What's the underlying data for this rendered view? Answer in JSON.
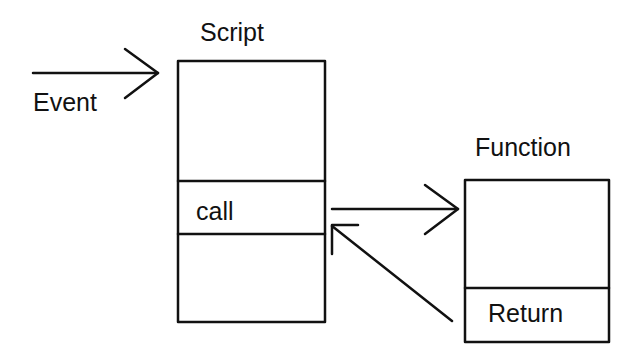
{
  "diagram": {
    "title_script": "Script",
    "title_function": "Function",
    "event_label": "Event",
    "call_label": "call",
    "return_label": "Return",
    "stroke_color": "#111111",
    "background": "#ffffff",
    "nodes": [
      {
        "id": "script",
        "label": "Script",
        "sections": [
          "",
          "call",
          ""
        ]
      },
      {
        "id": "function",
        "label": "Function",
        "sections": [
          "",
          "Return"
        ]
      }
    ],
    "edges": [
      {
        "from": "external",
        "to": "script",
        "label": "Event"
      },
      {
        "from": "script.call",
        "to": "function"
      },
      {
        "from": "function.return",
        "to": "script.call"
      }
    ]
  }
}
